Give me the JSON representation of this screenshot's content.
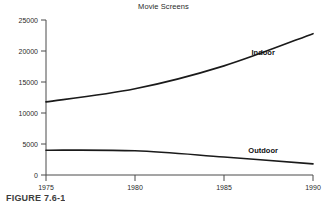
{
  "figure": {
    "caption": "FIGURE 7.6-1"
  },
  "chart_data": {
    "type": "line",
    "title": "Movie Screens",
    "xlabel": "",
    "ylabel": "",
    "x": [
      1975,
      1980,
      1985,
      1990
    ],
    "xlim": [
      1975,
      1990
    ],
    "ylim": [
      0,
      25000
    ],
    "xticks": [
      1975,
      1980,
      1985,
      1990
    ],
    "xticklabels": [
      "1975",
      "1980",
      "1985",
      "1990"
    ],
    "yticks": [
      0,
      5000,
      10000,
      15000,
      20000,
      25000
    ],
    "yticklabels": [
      "0",
      "5000",
      "10000",
      "15000",
      "20000",
      "25000"
    ],
    "grid": false,
    "legend": "inline-labels",
    "line_color": "#1a1a1a",
    "series": [
      {
        "name": "Indoor",
        "label": "Indoor",
        "values": [
          11800,
          13900,
          17600,
          22800
        ],
        "label_x": 1987.2,
        "label_y": 19400
      },
      {
        "name": "Outdoor",
        "label": "Outdoor",
        "values": [
          4000,
          3900,
          2900,
          1800
        ],
        "label_x": 1987.2,
        "label_y": 3600
      }
    ]
  }
}
